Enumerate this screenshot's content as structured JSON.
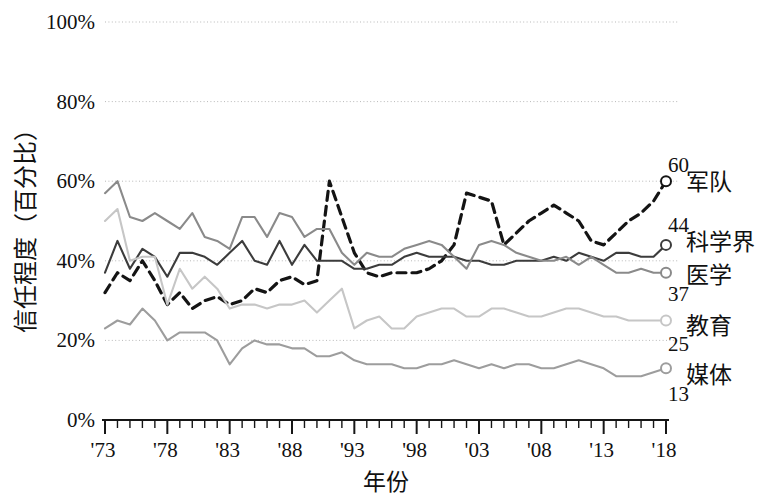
{
  "chart_data": {
    "type": "line",
    "title": "",
    "xlabel": "年份",
    "ylabel": "信任程度（百分比）",
    "xlim": [
      1973,
      2018
    ],
    "ylim": [
      0,
      100
    ],
    "ytick_labels": [
      "0%",
      "20%",
      "40%",
      "60%",
      "80%",
      "100%"
    ],
    "ytick_values": [
      0,
      20,
      40,
      60,
      80,
      100
    ],
    "xtick_labels": [
      "'73",
      "'78",
      "'83",
      "'88",
      "'93",
      "'98",
      "'03",
      "'08",
      "'13",
      "'18"
    ],
    "xtick_values": [
      1973,
      1978,
      1983,
      1988,
      1993,
      1998,
      2003,
      2008,
      2013,
      2018
    ],
    "minor_tick_step": 1,
    "grid": "horizontal-dotted",
    "legend_position": "right-end-of-line",
    "x": [
      1973,
      1974,
      1975,
      1976,
      1977,
      1978,
      1979,
      1980,
      1981,
      1982,
      1983,
      1984,
      1985,
      1986,
      1987,
      1988,
      1989,
      1990,
      1991,
      1992,
      1993,
      1994,
      1995,
      1996,
      1997,
      1998,
      1999,
      2000,
      2001,
      2002,
      2003,
      2004,
      2005,
      2006,
      2007,
      2008,
      2009,
      2010,
      2011,
      2012,
      2013,
      2014,
      2015,
      2016,
      2017,
      2018
    ],
    "series": [
      {
        "name": "军队",
        "end_value": 60,
        "color": "#141414",
        "style": "dashed",
        "values": [
          32,
          37,
          35,
          40,
          35,
          29,
          32,
          28,
          30,
          31,
          29,
          30,
          33,
          32,
          35,
          36,
          34,
          35,
          60,
          51,
          42,
          37,
          36,
          37,
          37,
          37,
          38,
          40,
          44,
          57,
          56,
          55,
          44,
          47,
          50,
          52,
          54,
          52,
          50,
          45,
          44,
          47,
          50,
          52,
          55,
          60
        ]
      },
      {
        "name": "科学界",
        "end_value": 44,
        "color": "#3c3c3c",
        "style": "solid",
        "values": [
          37,
          45,
          38,
          43,
          41,
          36,
          42,
          42,
          41,
          39,
          42,
          45,
          40,
          39,
          45,
          39,
          44,
          40,
          40,
          40,
          38,
          38,
          39,
          39,
          41,
          42,
          41,
          41,
          41,
          40,
          40,
          39,
          39,
          40,
          40,
          40,
          41,
          40,
          42,
          41,
          40,
          42,
          42,
          41,
          41,
          44
        ]
      },
      {
        "name": "医学",
        "end_value": 37,
        "color": "#8a8a8a",
        "style": "solid",
        "values": [
          57,
          60,
          51,
          50,
          52,
          50,
          48,
          52,
          46,
          45,
          43,
          51,
          51,
          46,
          52,
          51,
          46,
          48,
          48,
          42,
          39,
          42,
          41,
          41,
          43,
          44,
          45,
          44,
          41,
          38,
          44,
          45,
          44,
          42,
          41,
          40,
          40,
          41,
          39,
          41,
          39,
          37,
          37,
          38,
          37,
          37
        ]
      },
      {
        "name": "教育",
        "end_value": 25,
        "color": "#c6c6c6",
        "style": "solid",
        "values": [
          50,
          53,
          40,
          41,
          41,
          29,
          38,
          33,
          36,
          33,
          28,
          29,
          29,
          28,
          29,
          29,
          30,
          27,
          30,
          33,
          23,
          25,
          26,
          23,
          23,
          26,
          27,
          28,
          28,
          26,
          26,
          28,
          28,
          27,
          26,
          26,
          27,
          28,
          28,
          27,
          26,
          26,
          25,
          25,
          25,
          25
        ]
      },
      {
        "name": "媒体",
        "end_value": 13,
        "color": "#9d9d9d",
        "style": "solid",
        "values": [
          23,
          25,
          24,
          28,
          25,
          20,
          22,
          22,
          22,
          20,
          14,
          18,
          20,
          19,
          19,
          18,
          18,
          16,
          16,
          17,
          15,
          14,
          14,
          14,
          13,
          13,
          14,
          14,
          15,
          14,
          13,
          14,
          13,
          14,
          14,
          13,
          13,
          14,
          15,
          14,
          13,
          11,
          11,
          11,
          12,
          13
        ]
      }
    ]
  },
  "geometry": {
    "plot_left": 105,
    "plot_right": 666,
    "plot_top": 22,
    "plot_bottom": 420
  }
}
